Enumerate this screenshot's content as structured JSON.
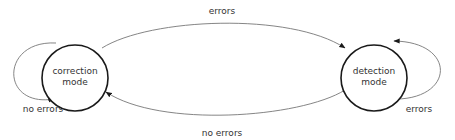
{
  "diagram": {
    "type": "state-machine",
    "colors": {
      "background": "#ffffff",
      "node_stroke": "#1a1a1a",
      "edge_stroke": "#777777",
      "arrowhead": "#1a1a1a",
      "text": "#333333"
    },
    "nodes": [
      {
        "id": "correction",
        "line1": "correction",
        "line2": "mode"
      },
      {
        "id": "detection",
        "line1": "detection",
        "line2": "mode"
      }
    ],
    "edges": [
      {
        "id": "correction-to-detection",
        "from": "correction",
        "to": "detection",
        "label": "errors"
      },
      {
        "id": "detection-to-correction",
        "from": "detection",
        "to": "correction",
        "label": "no errors"
      },
      {
        "id": "correction-self-loop",
        "from": "correction",
        "to": "correction",
        "label": "no errors"
      },
      {
        "id": "detection-self-loop",
        "from": "detection",
        "to": "detection",
        "label": "errors"
      }
    ]
  }
}
